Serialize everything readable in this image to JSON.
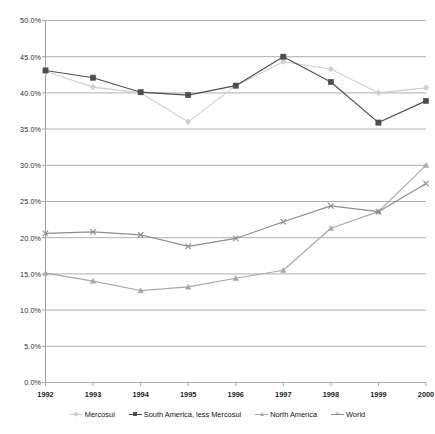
{
  "chart_data": {
    "type": "line",
    "title": "",
    "subtitle": "",
    "xlabel": "",
    "ylabel": "",
    "grid": true,
    "legend_position": "bottom",
    "x": [
      "1992",
      "1993",
      "1994",
      "1995",
      "1996",
      "1997",
      "1998",
      "1999",
      "2000"
    ],
    "categories": [
      "1992",
      "1993",
      "1994",
      "1995",
      "1996",
      "1997",
      "1998",
      "1999",
      "2000"
    ],
    "ylim": [
      0,
      50
    ],
    "ytick_labels": [
      "50.0%",
      "45.0%",
      "40.0%",
      "35.0%",
      "30.0%",
      "25.0%",
      "20.0%",
      "15.0%",
      "10.0%",
      "5.0%",
      "0.0%"
    ],
    "ytick_values": [
      50,
      45,
      40,
      35,
      30,
      25,
      20,
      15,
      10,
      5,
      0
    ],
    "units": "percent",
    "series": [
      {
        "name": "Mercosul",
        "color": "#cfcfcf",
        "marker": "diamond",
        "values": [
          43.0,
          40.8,
          40.0,
          36.0,
          41.0,
          44.3,
          43.3,
          40.0,
          40.7
        ]
      },
      {
        "name": "South America, less Mercosul",
        "color": "#4d4d4d",
        "marker": "square",
        "values": [
          43.1,
          42.1,
          40.1,
          39.7,
          41.0,
          45.0,
          41.5,
          35.9,
          38.9
        ]
      },
      {
        "name": "North America",
        "color": "#a8a8a8",
        "marker": "triangle",
        "values": [
          15.1,
          14.0,
          12.7,
          13.2,
          14.4,
          15.5,
          21.3,
          23.6,
          30.0
        ]
      },
      {
        "name": "World",
        "color": "#8c8c8c",
        "marker": "x",
        "values": [
          20.6,
          20.8,
          20.4,
          18.8,
          19.9,
          22.2,
          24.4,
          23.6,
          27.5
        ]
      }
    ]
  },
  "legend": {
    "items": [
      {
        "label": "Mercosul"
      },
      {
        "label": "South America, less Mercosul"
      },
      {
        "label": "North America"
      },
      {
        "label": "World"
      }
    ]
  }
}
